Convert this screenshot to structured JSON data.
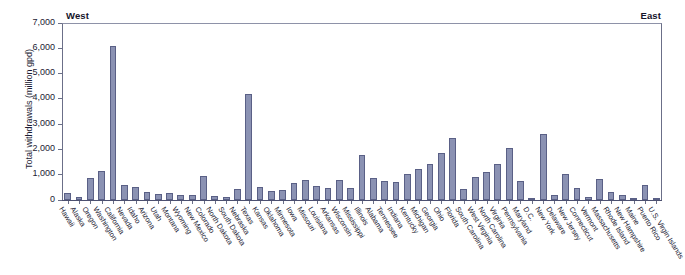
{
  "chart_data": {
    "type": "bar",
    "title": "",
    "subtitle": "",
    "xlabel": "",
    "ylabel": "Total withdrawals (million gpd)",
    "ylim": [
      0,
      7000
    ],
    "yticks": [
      "0",
      "1,000",
      "2,000",
      "3,000",
      "4,000",
      "5,000",
      "6,000",
      "7,000"
    ],
    "ytick_values": [
      0,
      1000,
      2000,
      3000,
      4000,
      5000,
      6000,
      7000
    ],
    "grid": false,
    "legend": "none",
    "annotations": [
      {
        "text": "West",
        "position": "top-left"
      },
      {
        "text": "East",
        "position": "top-right"
      }
    ],
    "categories": [
      "Hawaii",
      "Alaska",
      "Oregon",
      "Washington",
      "California",
      "Nevada",
      "Idaho",
      "Arizona",
      "Utah",
      "Montana",
      "Wyoming",
      "New Mexico",
      "Colorado",
      "North Dakota",
      "South Dakota",
      "Nebraska",
      "Texas",
      "Kansas",
      "Oklahoma",
      "Minnesota",
      "Iowa",
      "Missouri",
      "Louisiana",
      "Arkansas",
      "Wisconsin",
      "Mississippi",
      "Illinois",
      "Alabama",
      "Tennessee",
      "Indiana",
      "Kentucky",
      "Michigan",
      "Georgia",
      "Ohio",
      "Florida",
      "South Carolina",
      "West Virginia",
      "North Carolina",
      "Virginia",
      "Pennsylvania",
      "Maryland",
      "D.C.",
      "New York",
      "Delaware",
      "New Jersey",
      "Connecticut",
      "Vermont",
      "Massachusetts",
      "Rhode Island",
      "New Hampshire",
      "Maine",
      "Puerto Rico",
      "U.S. Virgin Islands"
    ],
    "values": [
      260,
      120,
      870,
      1150,
      6100,
      610,
      500,
      330,
      240,
      260,
      180,
      210,
      930,
      140,
      130,
      420,
      4200,
      510,
      340,
      400,
      690,
      800,
      560,
      460,
      800,
      470,
      1780,
      890,
      750,
      710,
      1010,
      1230,
      1420,
      1850,
      2450,
      450,
      920,
      1110,
      1430,
      2070,
      750,
      95,
      2600,
      180,
      1010,
      480,
      130,
      830,
      300,
      210,
      80,
      600,
      30
    ]
  }
}
